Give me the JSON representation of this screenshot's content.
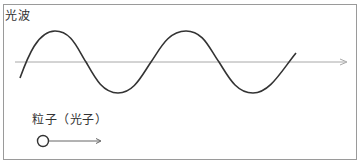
{
  "diagram": {
    "wave_label": "光波",
    "particle_label": "粒子（光子）",
    "colors": {
      "frame": "#9a9a9a",
      "wave": "#333333",
      "axis": "#a0a0a0",
      "particle": "#333333",
      "particle_arrow": "#555555"
    }
  }
}
